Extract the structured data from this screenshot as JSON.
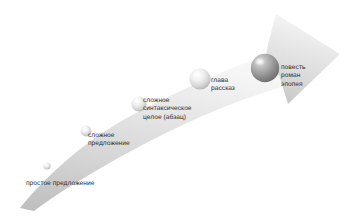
{
  "diagram": {
    "type": "arrow-progression",
    "colors": {
      "arrow_light": "#f2f2f2",
      "arrow_mid": "#d9d9d9",
      "arrow_dark": "#b9b9b9",
      "text": "#2e2e2e",
      "sphere_small": "#dcdcdc",
      "sphere_large": "#9a9a9a",
      "background": "#ffffff"
    },
    "arrow": {
      "direction": "up-right",
      "shape": "curved-tapering-band-with-triangular-head"
    },
    "nodes": [
      {
        "id": "prostoe-predlozhenie",
        "label_lines": [
          "простое предложение"
        ],
        "sphere": {
          "cx": 47,
          "cy": 166,
          "r": 3.6,
          "tone": "light"
        }
      },
      {
        "id": "slozhnoe-predlozhenie",
        "label_lines": [
          "сложное",
          "предложение"
        ],
        "sphere": {
          "cx": 86,
          "cy": 131,
          "r": 5.4,
          "tone": "light"
        }
      },
      {
        "id": "slozhnoe-sintaksicheskoe-tseloe",
        "label_lines": [
          "сложное",
          "синтаксическое",
          "целое (абзац)"
        ],
        "sphere": {
          "cx": 139,
          "cy": 104,
          "r": 7.6,
          "tone": "light"
        }
      },
      {
        "id": "glava-rasskaz",
        "label_lines": [
          "глава",
          "рассказ"
        ],
        "sphere": {
          "cx": 200,
          "cy": 79,
          "r": 10.6,
          "tone": "light"
        }
      },
      {
        "id": "povest-roman-epopeya",
        "label_lines": [
          "повесть",
          "роман",
          "эпопея"
        ],
        "sphere": {
          "cx": 265,
          "cy": 68,
          "r": 14.2,
          "tone": "dark"
        }
      }
    ]
  }
}
